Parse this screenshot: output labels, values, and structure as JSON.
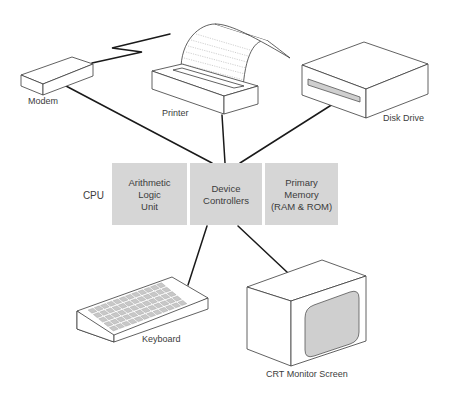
{
  "diagram": {
    "title": "",
    "cpu": {
      "label": "CPU",
      "blocks": [
        {
          "id": "alu",
          "lines": [
            "Arithmetic",
            "Logic",
            "Unit"
          ]
        },
        {
          "id": "device-controllers",
          "lines": [
            "Device",
            "Controllers"
          ]
        },
        {
          "id": "primary-memory",
          "lines": [
            "Primary",
            "Memory",
            "(RAM & ROM)"
          ]
        }
      ],
      "block_color": "#d6d6d6"
    },
    "devices": {
      "modem": {
        "label": "Modem"
      },
      "printer": {
        "label": "Printer"
      },
      "disk_drive": {
        "label": "Disk Drive"
      },
      "keyboard": {
        "label": "Keyboard"
      },
      "monitor": {
        "label": "CRT Monitor Screen"
      }
    },
    "connections": [
      {
        "from": "modem",
        "to": "device-controllers"
      },
      {
        "from": "printer",
        "to": "device-controllers"
      },
      {
        "from": "disk_drive",
        "to": "device-controllers"
      },
      {
        "from": "keyboard",
        "to": "device-controllers"
      },
      {
        "from": "monitor",
        "to": "device-controllers"
      },
      {
        "from": "modem",
        "to": "printer",
        "style": "zigzag"
      }
    ]
  }
}
